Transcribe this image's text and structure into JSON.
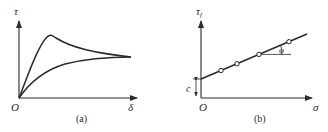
{
  "panel_a": {
    "caption": "(a)",
    "y_label": "τ",
    "x_label": "δ",
    "origin_label": "O",
    "curves": [
      {
        "name": "dense-sand-peak-curve",
        "description": "rises to peak then softens to residual"
      },
      {
        "name": "loose-sand-curve",
        "description": "rises monotonically to residual"
      }
    ]
  },
  "panel_b": {
    "caption": "(b)",
    "y_label": "τ",
    "y_label_sub": "f",
    "x_label": "σ",
    "origin_label": "O",
    "intercept_label": "c",
    "angle_label": "φ",
    "points_count": 4
  }
}
